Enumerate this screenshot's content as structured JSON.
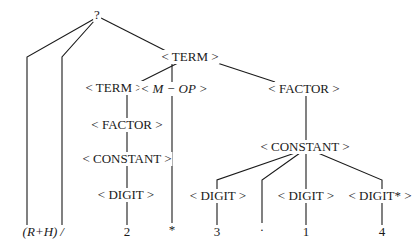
{
  "diagram": {
    "type": "parse-tree",
    "root": {
      "id": "root",
      "label": "?",
      "x": 97,
      "y": 15
    },
    "nodes": [
      {
        "id": "term_top",
        "label": "< TERM >",
        "x": 190,
        "y": 57
      },
      {
        "id": "term_left",
        "label": "< TERM >",
        "x": 114,
        "y": 88
      },
      {
        "id": "mop",
        "label": "< M − OP >",
        "x": 174,
        "y": 89,
        "italic": true
      },
      {
        "id": "factor_right",
        "label": "< FACTOR >",
        "x": 304,
        "y": 89
      },
      {
        "id": "factor_left",
        "label": "< FACTOR >",
        "x": 127,
        "y": 125
      },
      {
        "id": "constant_left",
        "label": "< CONSTANT >",
        "x": 127,
        "y": 159
      },
      {
        "id": "digit_left",
        "label": "< DIGIT >",
        "x": 126,
        "y": 195
      },
      {
        "id": "constant_right",
        "label": "< CONSTANT >",
        "x": 305,
        "y": 147
      },
      {
        "id": "digit_3",
        "label": "< DIGIT >",
        "x": 218,
        "y": 196
      },
      {
        "id": "digit_1",
        "label": "< DIGIT >",
        "x": 306,
        "y": 196
      },
      {
        "id": "digit_star",
        "label": "< DIGIT* >",
        "x": 380,
        "y": 196
      }
    ],
    "leaves": [
      {
        "id": "leaf_rh",
        "label": "(R+H)",
        "x": 40,
        "y": 232,
        "italic": true
      },
      {
        "id": "leaf_slash",
        "label": "/",
        "x": 62,
        "y": 232,
        "italic": true
      },
      {
        "id": "leaf_2",
        "label": "2",
        "x": 127,
        "y": 232
      },
      {
        "id": "leaf_star",
        "label": "*",
        "x": 172,
        "y": 230
      },
      {
        "id": "leaf_3",
        "label": "3",
        "x": 217,
        "y": 232
      },
      {
        "id": "leaf_dot",
        "label": "·",
        "x": 262,
        "y": 230
      },
      {
        "id": "leaf_1",
        "label": "1",
        "x": 306,
        "y": 232
      },
      {
        "id": "leaf_4",
        "label": "4",
        "x": 382,
        "y": 232
      }
    ],
    "edges": [
      {
        "from": [
          94,
          19
        ],
        "to": [
          27,
          57
        ],
        "then": [
          27,
          226
        ]
      },
      {
        "from": [
          95,
          20
        ],
        "to": [
          62,
          57
        ],
        "then": [
          62,
          226
        ]
      },
      {
        "from": [
          101,
          18
        ],
        "to": [
          168,
          52
        ]
      },
      {
        "from": [
          178,
          63
        ],
        "to": [
          136,
          84
        ]
      },
      {
        "from": [
          172,
          63
        ],
        "to": [
          172,
          84
        ]
      },
      {
        "from": [
          205,
          59
        ],
        "to": [
          275,
          82
        ]
      },
      {
        "from": [
          127,
          94
        ],
        "to": [
          127,
          119
        ]
      },
      {
        "from": [
          127,
          131
        ],
        "to": [
          127,
          153
        ]
      },
      {
        "from": [
          127,
          165
        ],
        "to": [
          127,
          189
        ]
      },
      {
        "from": [
          127,
          201
        ],
        "to": [
          127,
          226
        ]
      },
      {
        "from": [
          172,
          95
        ],
        "to": [
          172,
          225
        ]
      },
      {
        "from": [
          306,
          95
        ],
        "to": [
          306,
          141
        ]
      },
      {
        "from": [
          295,
          153
        ],
        "to": [
          217,
          180
        ],
        "then": [
          217,
          226
        ]
      },
      {
        "from": [
          300,
          153
        ],
        "to": [
          262,
          180
        ],
        "then": [
          262,
          226
        ]
      },
      {
        "from": [
          306,
          153
        ],
        "to": [
          306,
          226
        ]
      },
      {
        "from": [
          318,
          153
        ],
        "to": [
          382,
          180
        ],
        "then": [
          382,
          226
        ]
      }
    ]
  }
}
